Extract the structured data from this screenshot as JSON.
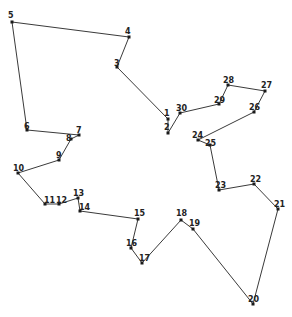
{
  "diagram": {
    "type": "tour-path",
    "stroke_color": "#3a3a3a",
    "node_color": "#1a1a1a",
    "nodes": [
      {
        "id": "1",
        "x": 168,
        "y": 119,
        "lx": 164,
        "ly": 116
      },
      {
        "id": "2",
        "x": 168,
        "y": 133,
        "lx": 164,
        "ly": 130
      },
      {
        "id": "3",
        "x": 117,
        "y": 67,
        "lx": 114,
        "ly": 66
      },
      {
        "id": "4",
        "x": 129,
        "y": 37,
        "lx": 125,
        "ly": 34
      },
      {
        "id": "5",
        "x": 12,
        "y": 22,
        "lx": 8,
        "ly": 18
      },
      {
        "id": "6",
        "x": 27,
        "y": 130,
        "lx": 24,
        "ly": 129
      },
      {
        "id": "7",
        "x": 79,
        "y": 135,
        "lx": 76,
        "ly": 133
      },
      {
        "id": "8",
        "x": 71,
        "y": 139,
        "lx": 66,
        "ly": 141
      },
      {
        "id": "9",
        "x": 59,
        "y": 160,
        "lx": 56,
        "ly": 158
      },
      {
        "id": "10",
        "x": 18,
        "y": 173,
        "lx": 13,
        "ly": 171
      },
      {
        "id": "11",
        "x": 45,
        "y": 204,
        "lx": 44,
        "ly": 203
      },
      {
        "id": "12",
        "x": 59,
        "y": 204,
        "lx": 56,
        "ly": 203
      },
      {
        "id": "13",
        "x": 78,
        "y": 198,
        "lx": 73,
        "ly": 196
      },
      {
        "id": "14",
        "x": 80,
        "y": 211,
        "lx": 79,
        "ly": 210
      },
      {
        "id": "15",
        "x": 138,
        "y": 219,
        "lx": 134,
        "ly": 216
      },
      {
        "id": "16",
        "x": 131,
        "y": 248,
        "lx": 126,
        "ly": 246
      },
      {
        "id": "17",
        "x": 142,
        "y": 263,
        "lx": 139,
        "ly": 261
      },
      {
        "id": "18",
        "x": 181,
        "y": 220,
        "lx": 176,
        "ly": 216
      },
      {
        "id": "19",
        "x": 193,
        "y": 229,
        "lx": 189,
        "ly": 226
      },
      {
        "id": "20",
        "x": 253,
        "y": 304,
        "lx": 248,
        "ly": 302
      },
      {
        "id": "21",
        "x": 278,
        "y": 209,
        "lx": 274,
        "ly": 207
      },
      {
        "id": "22",
        "x": 254,
        "y": 184,
        "lx": 250,
        "ly": 182
      },
      {
        "id": "23",
        "x": 219,
        "y": 190,
        "lx": 215,
        "ly": 188
      },
      {
        "id": "24",
        "x": 198,
        "y": 140,
        "lx": 192,
        "ly": 138
      },
      {
        "id": "25",
        "x": 210,
        "y": 145,
        "lx": 205,
        "ly": 146
      },
      {
        "id": "26",
        "x": 254,
        "y": 112,
        "lx": 249,
        "ly": 110
      },
      {
        "id": "27",
        "x": 265,
        "y": 91,
        "lx": 261,
        "ly": 88
      },
      {
        "id": "28",
        "x": 228,
        "y": 85,
        "lx": 223,
        "ly": 83
      },
      {
        "id": "29",
        "x": 219,
        "y": 104,
        "lx": 214,
        "ly": 103
      },
      {
        "id": "30",
        "x": 180,
        "y": 113,
        "lx": 176,
        "ly": 111
      }
    ],
    "path_order": [
      "1",
      "2",
      "30",
      "29",
      "28",
      "27",
      "26",
      "24",
      "25",
      "23",
      "22",
      "21",
      "20",
      "19",
      "18",
      "17",
      "16",
      "15",
      "14",
      "13",
      "12",
      "11",
      "10",
      "9",
      "8",
      "7",
      "6",
      "5",
      "4",
      "3",
      "1"
    ]
  }
}
